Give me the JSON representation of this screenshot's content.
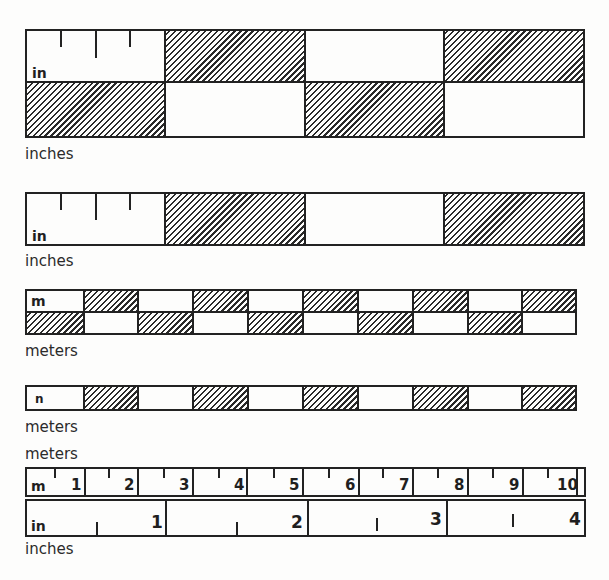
{
  "figure": {
    "ruler1": {
      "unit_label": "in",
      "caption": "inches",
      "rows": 2,
      "segments": 4,
      "top_pattern": [
        "blank",
        "hatch",
        "blank",
        "hatch"
      ],
      "bottom_pattern": [
        "hatch",
        "blank",
        "hatch",
        "blank"
      ],
      "ticks_in_first_segment": 3
    },
    "ruler2": {
      "unit_label": "in",
      "caption": "inches",
      "rows": 1,
      "segments": 4,
      "pattern": [
        "blank",
        "hatch",
        "blank",
        "hatch"
      ],
      "ticks_in_first_segment": 3
    },
    "ruler3": {
      "unit_label": "m",
      "caption": "meters",
      "rows": 2,
      "segments": 10,
      "top_pattern": [
        "blank",
        "hatch",
        "blank",
        "hatch",
        "blank",
        "hatch",
        "blank",
        "hatch",
        "blank",
        "hatch"
      ],
      "bottom_pattern": [
        "hatch",
        "blank",
        "hatch",
        "blank",
        "hatch",
        "blank",
        "hatch",
        "blank",
        "hatch",
        "blank"
      ]
    },
    "ruler4": {
      "unit_label": "n",
      "caption": "meters",
      "rows": 1,
      "segments": 10,
      "pattern": [
        "blank",
        "hatch",
        "blank",
        "hatch",
        "blank",
        "hatch",
        "blank",
        "hatch",
        "blank",
        "hatch"
      ]
    },
    "combined": {
      "top_caption": "meters",
      "meter_row": {
        "unit_label": "m",
        "numbers": [
          "1",
          "2",
          "3",
          "4",
          "5",
          "6",
          "7",
          "8",
          "9",
          "10"
        ]
      },
      "inch_row": {
        "unit_label": "in",
        "numbers": [
          "1",
          "2",
          "3",
          "4"
        ]
      },
      "bottom_caption": "inches"
    }
  }
}
